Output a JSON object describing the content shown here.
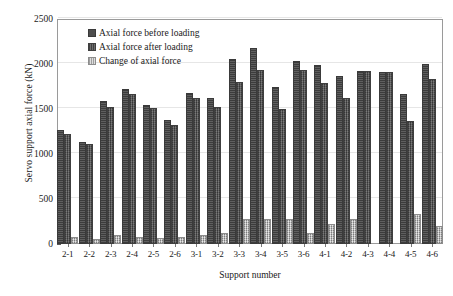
{
  "chart_data": {
    "type": "bar",
    "title": "",
    "xlabel": "Support number",
    "ylabel": "Servo support axial force (kN)",
    "ylim": [
      0,
      2500
    ],
    "yticks": [
      0,
      500,
      1000,
      1500,
      2000,
      2500
    ],
    "ytick_labels": [
      "0",
      "500",
      "1000",
      "1500",
      "2000",
      "2500"
    ],
    "grid": true,
    "legend_position": "top-left-inside",
    "categories": [
      "2-1",
      "2-2",
      "2-3",
      "2-4",
      "2-5",
      "2-6",
      "3-1",
      "3-2",
      "3-3",
      "3-4",
      "3-5",
      "3-6",
      "4-1",
      "4-2",
      "4-3",
      "4-4",
      "4-5",
      "4-6"
    ],
    "series": [
      {
        "name": "Axial force before loading",
        "color": "#4d4d4d",
        "values": [
          1245,
          1115,
          1570,
          1705,
          1520,
          1355,
          1660,
          1605,
          2030,
          2155,
          1720,
          2015,
          1965,
          1840,
          1895,
          1890,
          1640,
          1980
        ]
      },
      {
        "name": "Axial force after loading",
        "color": "#565656",
        "values": [
          1200,
          1085,
          1500,
          1650,
          1485,
          1300,
          1595,
          1505,
          1775,
          1915,
          1480,
          1910,
          1770,
          1600,
          1900,
          1885,
          1340,
          1810
        ]
      },
      {
        "name": "Change of axial force",
        "color": "#b9b9b9",
        "values": [
          55,
          30,
          80,
          55,
          45,
          55,
          75,
          105,
          255,
          255,
          255,
          100,
          200,
          255,
          0,
          0,
          310,
          175
        ]
      }
    ]
  },
  "legend": {
    "items": [
      {
        "label": "Axial force before loading",
        "swatch": "s1"
      },
      {
        "label": "Axial force after loading",
        "swatch": "s2"
      },
      {
        "label": "Change of axial force",
        "swatch": "s3"
      }
    ]
  }
}
